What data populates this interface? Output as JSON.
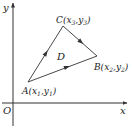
{
  "diagram": {
    "type": "coordinate-triangle",
    "axes": {
      "origin_label": "O",
      "x_label": "x",
      "y_label": "y"
    },
    "region_label": "D",
    "vertices": [
      {
        "name": "A",
        "label_main": "A(x",
        "sub1": "1",
        "mid": ",y",
        "sub2": "1",
        "close": ")",
        "coords": [
          28,
          82
        ]
      },
      {
        "name": "B",
        "label_main": "B(x",
        "sub1": "2",
        "mid": ",y",
        "sub2": "2",
        "close": ")",
        "coords": [
          97,
          56
        ]
      },
      {
        "name": "C",
        "label_main": "C(x",
        "sub1": "3",
        "mid": ",y",
        "sub2": "3",
        "close": ")",
        "coords": [
          63,
          26
        ]
      }
    ],
    "edges": [
      {
        "from": "A",
        "to": "C",
        "directed": true
      },
      {
        "from": "C",
        "to": "B",
        "directed": true
      },
      {
        "from": "A",
        "to": "B",
        "directed": true
      }
    ],
    "colors": {
      "line": "#333333",
      "text": "#222222",
      "background": "#ffffff"
    }
  }
}
